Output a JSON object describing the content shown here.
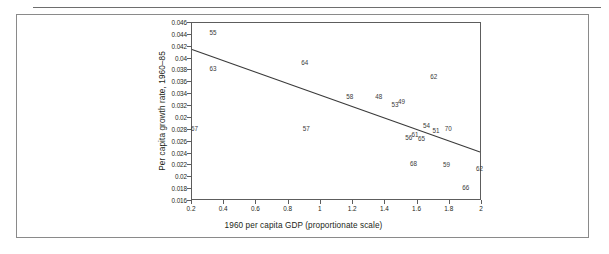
{
  "figure": {
    "frame_color": "#8a8a8a",
    "axis_color": "#5d5d5d",
    "text_color": "#231f20"
  },
  "chart_data": {
    "type": "scatter",
    "title": "",
    "xlabel": "1960 per capita GDP (proportionate scale)",
    "ylabel": "Per capita growth rate, 1960–85",
    "xlim": [
      0.2,
      2.0
    ],
    "ylim": [
      0.016,
      0.046
    ],
    "grid": false,
    "legend": "none",
    "xticks": [
      "0.2",
      "0.4",
      "0.6",
      "0.8",
      "1",
      "1.2",
      "1.4",
      "1.6",
      "1.8",
      "2"
    ],
    "xtick_values": [
      0.2,
      0.4,
      0.6,
      0.8,
      1.0,
      1.2,
      1.4,
      1.6,
      1.8,
      2.0
    ],
    "yticks": [
      "0.046",
      "0.044",
      "0.042",
      "0.04",
      "0.038",
      "0.036",
      "0.034",
      "0.032",
      "0.02",
      "0.028",
      "0.026",
      "0.024",
      "0.022",
      "0.02",
      "0.018",
      "0.016"
    ],
    "ytick_values": [
      0.046,
      0.044,
      0.042,
      0.04,
      0.038,
      0.036,
      0.034,
      0.032,
      0.03,
      0.028,
      0.026,
      0.024,
      0.022,
      0.02,
      0.018,
      0.016
    ],
    "marker_style": "numeric-label",
    "points": [
      {
        "label": "55",
        "x": 0.33,
        "y": 0.0443
      },
      {
        "label": "63",
        "x": 0.33,
        "y": 0.0382
      },
      {
        "label": "67",
        "x": 0.215,
        "y": 0.0281
      },
      {
        "label": "64",
        "x": 0.9,
        "y": 0.0393
      },
      {
        "label": "57",
        "x": 0.91,
        "y": 0.0282
      },
      {
        "label": "58",
        "x": 1.18,
        "y": 0.0336
      },
      {
        "label": "48",
        "x": 1.36,
        "y": 0.0335
      },
      {
        "label": "53",
        "x": 1.46,
        "y": 0.0322
      },
      {
        "label": "49",
        "x": 1.5,
        "y": 0.0327
      },
      {
        "label": "62",
        "x": 1.7,
        "y": 0.0369
      },
      {
        "label": "56",
        "x": 1.545,
        "y": 0.0266
      },
      {
        "label": "61",
        "x": 1.585,
        "y": 0.0271
      },
      {
        "label": "65",
        "x": 1.625,
        "y": 0.0264
      },
      {
        "label": "54",
        "x": 1.655,
        "y": 0.0286
      },
      {
        "label": "51",
        "x": 1.715,
        "y": 0.0278
      },
      {
        "label": "70",
        "x": 1.79,
        "y": 0.0281
      },
      {
        "label": "68",
        "x": 1.575,
        "y": 0.0222
      },
      {
        "label": "59",
        "x": 1.78,
        "y": 0.0221
      },
      {
        "label": "62",
        "x": 1.985,
        "y": 0.0214
      },
      {
        "label": "66",
        "x": 1.9,
        "y": 0.0182
      }
    ],
    "trendline": {
      "type": "linear-fit",
      "x_start": 0.2,
      "y_start": 0.0415,
      "x_end": 2.0,
      "y_end": 0.024,
      "color": "#3a3a3a"
    }
  }
}
